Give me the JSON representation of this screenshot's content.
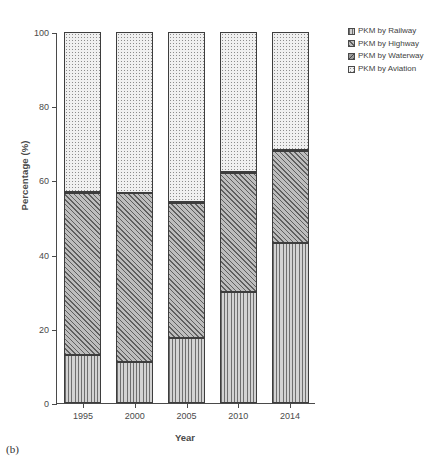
{
  "caption": "(b)",
  "chart_data": {
    "type": "bar",
    "subtype": "stacked-percentage",
    "title": "",
    "xlabel": "Year",
    "ylabel": "Percentage (%)",
    "categories": [
      "1995",
      "2000",
      "2005",
      "2010",
      "2014"
    ],
    "ylim": [
      0,
      100
    ],
    "yticks": [
      0,
      20,
      40,
      60,
      80,
      100
    ],
    "grid": false,
    "legend_position": "right",
    "series": [
      {
        "name": "PKM by Railway",
        "pattern": "vertical-lines",
        "values": [
          13.0,
          11.0,
          17.5,
          30.0,
          43.0
        ]
      },
      {
        "name": "PKM by Highway",
        "pattern": "diagonal-hatch",
        "values": [
          43.5,
          45.5,
          36.5,
          32.0,
          25.0
        ]
      },
      {
        "name": "PKM by Waterway",
        "pattern": "cross-hatch",
        "values": [
          0.3,
          0.2,
          0.2,
          0.2,
          0.2
        ]
      },
      {
        "name": "PKM by Aviation",
        "pattern": "dotted",
        "values": [
          43.2,
          43.3,
          45.8,
          37.8,
          31.8
        ]
      }
    ],
    "stack_tops": {
      "railway": [
        13.0,
        11.0,
        17.5,
        30.0,
        43.0
      ],
      "highway": [
        56.5,
        56.5,
        54.0,
        62.0,
        68.0
      ],
      "waterway": [
        56.8,
        56.7,
        54.2,
        62.2,
        68.2
      ],
      "aviation": [
        100,
        100,
        100,
        100,
        100
      ]
    }
  },
  "legend": {
    "items": [
      {
        "label": "PKM by Railway",
        "pattern": "vertical-lines"
      },
      {
        "label": "PKM by Highway",
        "pattern": "diagonal-hatch"
      },
      {
        "label": "PKM by Waterway",
        "pattern": "cross-hatch"
      },
      {
        "label": "PKM by Aviation",
        "pattern": "dotted"
      }
    ]
  },
  "colors": {
    "axis": "#4a4a4a",
    "segment_border": "#3d3d3d",
    "railway_fill": "#d2d2d2",
    "highway_fill": "#bdbdbd",
    "waterway_fill": "#9b9b9b",
    "aviation_fill": "#f0f0f0"
  }
}
